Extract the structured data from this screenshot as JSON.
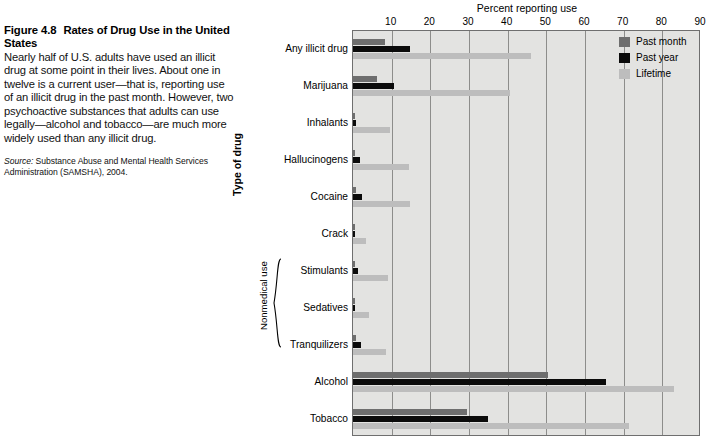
{
  "figure": {
    "title_number": "Figure 4.8",
    "title_text": "Rates of Drug Use in the United States",
    "body": "Nearly half of U.S. adults have used an illicit drug at some point in their lives. About one in twelve is a current user—that is, reporting use of an illicit drug in the past month. However, two psychoactive substances that adults can use legally—alcohol and tobacco—are much more widely used than any illicit drug.",
    "source_label": "Source:",
    "source_text": " Substance Abuse and Mental Health Services Administration (SAMSHA), 2004."
  },
  "colors": {
    "past_month": "#6e6e6e",
    "past_year": "#0b0b0b",
    "lifetime": "#bdbdbd",
    "plot_background": "#e3e3e1",
    "gridline": "#8d8d8b",
    "plot_border": "#6f6f6f"
  },
  "axis": {
    "x_title": "Percent reporting use",
    "y_title": "Type of drug",
    "group_label": "Nonmedical use",
    "ticks": [
      "10",
      "20",
      "30",
      "40",
      "50",
      "60",
      "70",
      "80",
      "90"
    ]
  },
  "legend": {
    "items": [
      {
        "label": "Past month",
        "color": "#6e6e6e",
        "swatch_name": "legend-swatch-past-month"
      },
      {
        "label": "Past year",
        "color": "#0b0b0b",
        "swatch_name": "legend-swatch-past-year"
      },
      {
        "label": "Lifetime",
        "color": "#bdbdbd",
        "swatch_name": "legend-swatch-lifetime"
      }
    ]
  },
  "chart_data": {
    "type": "bar",
    "orientation": "horizontal",
    "title": "Rates of Drug Use in the United States",
    "xlabel": "Percent reporting use",
    "ylabel": "Type of drug",
    "xlim": [
      0,
      90
    ],
    "xticks": [
      0,
      10,
      20,
      30,
      40,
      50,
      60,
      70,
      80,
      90
    ],
    "grid": true,
    "legend_position": "top-right",
    "categories": [
      "Any illicit drug",
      "Marijuana",
      "Inhalants",
      "Hallucinogens",
      "Cocaine",
      "Crack",
      "Stimulants",
      "Sedatives",
      "Tranquilizers",
      "Alcohol",
      "Tobacco"
    ],
    "grouped_categories": {
      "Nonmedical use": [
        "Stimulants",
        "Sedatives",
        "Tranquilizers"
      ]
    },
    "series": [
      {
        "name": "Past month",
        "color": "#6e6e6e",
        "values": [
          8.2,
          6.2,
          0.3,
          0.4,
          0.8,
          0.3,
          0.5,
          0.2,
          0.8,
          50.5,
          29.5
        ]
      },
      {
        "name": "Past year",
        "color": "#0b0b0b",
        "values": [
          14.7,
          10.6,
          0.9,
          1.9,
          2.4,
          0.6,
          1.4,
          0.4,
          2.1,
          65.5,
          35.0
        ]
      },
      {
        "name": "Lifetime",
        "color": "#bdbdbd",
        "values": [
          46.0,
          40.6,
          9.5,
          14.5,
          14.7,
          3.3,
          9.0,
          4.2,
          8.5,
          83.1,
          71.5
        ]
      }
    ]
  }
}
